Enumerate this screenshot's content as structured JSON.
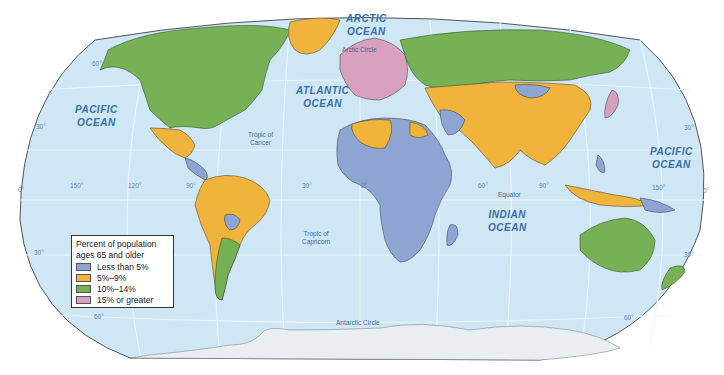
{
  "colors": {
    "ocean": "#cfe6f4",
    "antarctica": "#e9eef1",
    "less_than_5": "#8ea4d2",
    "5_to_9": "#f0b43c",
    "10_to_14": "#76b255",
    "15_or_greater": "#d7a0be",
    "border": "#2f3b2a",
    "graticule": "#eaf4fb"
  },
  "legend": {
    "title_line1": "Percent of population",
    "title_line2": "ages 65 and older",
    "items": [
      {
        "label": "Less than 5%",
        "color": "#8ea4d2"
      },
      {
        "label": "5%–9%",
        "color": "#f0b43c"
      },
      {
        "label": "10%–14%",
        "color": "#76b255"
      },
      {
        "label": "15% or greater",
        "color": "#d7a0be"
      }
    ]
  },
  "oceans": {
    "arctic": "ARCTIC\nOCEAN",
    "atlantic": "ATLANTIC\nOCEAN",
    "pacific_west": "PACIFIC\nOCEAN",
    "pacific_east": "PACIFIC\nOCEAN",
    "indian": "INDIAN\nOCEAN"
  },
  "lines": {
    "arctic_circle": "Arctic Circle",
    "tropic_cancer": "Tropic of\nCancer",
    "equator": "Equator",
    "tropic_capricorn": "Tropic of\nCapricorn",
    "antarctic_circle": "Antarctic Circle"
  },
  "degrees": {
    "lat_60_n_w": "60°",
    "lat_30_n_w": "30°",
    "lat_0_w": "0°",
    "lat_30_s_w": "30°",
    "lat_60_s_w": "60°",
    "lat_30_n_e": "30°",
    "lat_0_e": "0°",
    "lat_30_s_e": "30°",
    "lat_60_s_e": "60°",
    "lon_150w": "150°",
    "lon_120w": "120°",
    "lon_90w": "90°",
    "lon_30w": "30°",
    "lon_0": "0°",
    "lon_60e": "60°",
    "lon_90e": "90°",
    "lon_150e": "150°"
  }
}
